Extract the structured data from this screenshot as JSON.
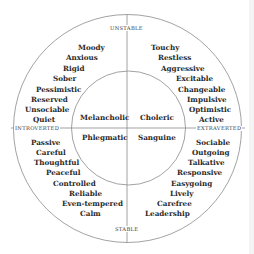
{
  "axes": {
    "top": "UNSTABLE",
    "bottom": "STABLE",
    "left": "INTROVERTED",
    "right": "EXTRAVERTED"
  },
  "temperaments": {
    "top_left": "Melancholic",
    "top_right": "Choleric",
    "bottom_left": "Phlegmatic",
    "bottom_right": "Sanguine"
  },
  "traits": {
    "melancholic": [
      "Moody",
      "Anxious",
      "Rigid",
      "Sober",
      "Pessimistic",
      "Reserved",
      "Unsociable",
      "Quiet"
    ],
    "choleric": [
      "Touchy",
      "Restless",
      "Aggressive",
      "Excitable",
      "Changeable",
      "Impulsive",
      "Optimistic",
      "Active"
    ],
    "phlegmatic": [
      "Passive",
      "Careful",
      "Thoughtful",
      "Peaceful",
      "Controlled",
      "Reliable",
      "Even-tempered",
      "Calm"
    ],
    "sanguine": [
      "Sociable",
      "Outgoing",
      "Talkative",
      "Responsive",
      "Easygoing",
      "Lively",
      "Carefree",
      "Leadership"
    ]
  },
  "colors": {
    "line": "#8a8a8a",
    "text": "#2a2a2a"
  }
}
